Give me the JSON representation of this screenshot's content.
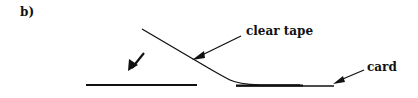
{
  "figure": {
    "panel_label": "b)",
    "labels": {
      "tape": "clear tape",
      "card": "card"
    },
    "colors": {
      "ink": "#111111",
      "background": "#ffffff"
    }
  }
}
